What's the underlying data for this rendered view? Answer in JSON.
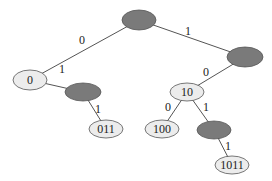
{
  "diagram": {
    "type": "binary-trie",
    "colors": {
      "internal_node": "#7a7a7a",
      "leaf_node": "#ececec",
      "edge": "#555555"
    },
    "nodes": [
      {
        "id": "root",
        "label": "",
        "kind": "internal",
        "cx": 139,
        "cy": 20,
        "rx": 17,
        "ry": 10
      },
      {
        "id": "n0",
        "label": "0",
        "kind": "leaf",
        "cx": 30,
        "cy": 80,
        "rx": 17,
        "ry": 10
      },
      {
        "id": "n1",
        "label": "",
        "kind": "internal",
        "cx": 245,
        "cy": 57,
        "rx": 18,
        "ry": 10
      },
      {
        "id": "n01",
        "label": "",
        "kind": "internal",
        "cx": 83,
        "cy": 92,
        "rx": 18,
        "ry": 9
      },
      {
        "id": "n011",
        "label": "011",
        "kind": "leaf",
        "cx": 106,
        "cy": 129,
        "rx": 17,
        "ry": 9
      },
      {
        "id": "n10",
        "label": "10",
        "kind": "leaf",
        "cx": 187,
        "cy": 92,
        "rx": 17,
        "ry": 9
      },
      {
        "id": "n100",
        "label": "100",
        "kind": "leaf",
        "cx": 162,
        "cy": 129,
        "rx": 17,
        "ry": 9
      },
      {
        "id": "n101",
        "label": "",
        "kind": "internal",
        "cx": 214,
        "cy": 130,
        "rx": 17,
        "ry": 9
      },
      {
        "id": "n1011",
        "label": "1011",
        "kind": "leaf",
        "cx": 232,
        "cy": 165,
        "rx": 17,
        "ry": 9
      }
    ],
    "edges": [
      {
        "from": "root",
        "to": "n0",
        "label": "0",
        "lx": 82,
        "ly": 44
      },
      {
        "from": "root",
        "to": "n1",
        "label": "1",
        "lx": 188,
        "ly": 35
      },
      {
        "from": "n0",
        "to": "n01",
        "label": "1",
        "lx": 62,
        "ly": 73
      },
      {
        "from": "n01",
        "to": "n011",
        "label": "1",
        "lx": 98,
        "ly": 113
      },
      {
        "from": "n1",
        "to": "n10",
        "label": "0",
        "lx": 206,
        "ly": 76
      },
      {
        "from": "n10",
        "to": "n100",
        "label": "0",
        "lx": 168,
        "ly": 111
      },
      {
        "from": "n10",
        "to": "n101",
        "label": "1",
        "lx": 206,
        "ly": 111
      },
      {
        "from": "n101",
        "to": "n1011",
        "label": "1",
        "lx": 228,
        "ly": 150
      }
    ]
  }
}
